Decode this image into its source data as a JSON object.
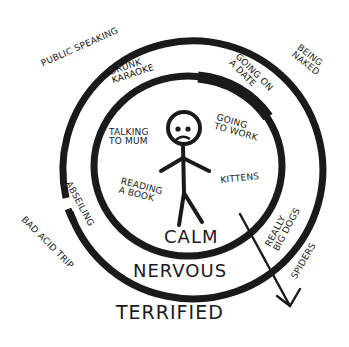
{
  "diagram": {
    "type": "concentric comfort-zone diagram",
    "colors": {
      "ink": "#1a1a1a",
      "background": "#ffffff"
    },
    "zones": [
      {
        "id": "calm",
        "label": "CALM"
      },
      {
        "id": "nervous",
        "label": "NERVOUS"
      },
      {
        "id": "terrified",
        "label": "TERRIFIED"
      }
    ],
    "calm_items": [
      {
        "label": "TALKING\nTO MUM"
      },
      {
        "label": "READING\nA BOOK"
      },
      {
        "label": "GOING\nTO WORK"
      },
      {
        "label": "KITTENS"
      }
    ],
    "nervous_items": [
      {
        "label": "DRUNK\nKARAOKE"
      },
      {
        "label": "GOING ON\nA DATE"
      },
      {
        "label": "ABSEILING"
      },
      {
        "label": "REALLY\nBIG DOGS"
      }
    ],
    "terrified_items": [
      {
        "label": "PUBLIC SPEAKING"
      },
      {
        "label": "BEING\nNAKED"
      },
      {
        "label": "BAD ACID TRIP"
      },
      {
        "label": "SPIDERS"
      }
    ],
    "figure": {
      "description": "stick figure with worried face in the center"
    },
    "arrow": {
      "description": "arrow pointing outward from the calm zone through nervous into terrified"
    }
  }
}
